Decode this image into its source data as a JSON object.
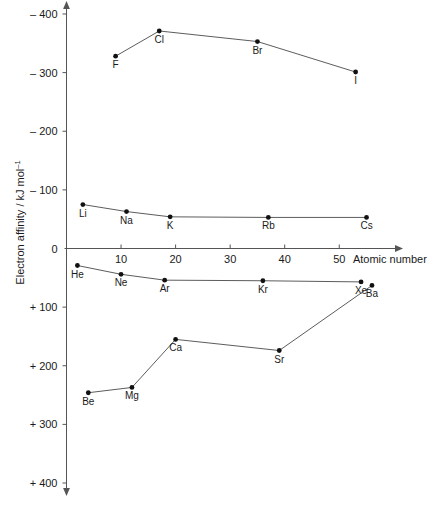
{
  "chart_data": {
    "type": "line",
    "title": "",
    "xlabel": "Atomic number",
    "ylabel": "Electron affinity / kJ mol−1",
    "ylabel_base": "Electron affinity / kJ mol",
    "ylabel_exponent": "–1",
    "xlim": [
      0,
      60
    ],
    "ylim": [
      -400,
      400
    ],
    "y_axis_inverted": true,
    "grid": false,
    "legend": "none",
    "x_ticks": [
      10,
      20,
      30,
      40,
      50
    ],
    "x_tick_labels": [
      "10",
      "20",
      "30",
      "40",
      "50"
    ],
    "y_ticks": [
      -400,
      -300,
      -200,
      -100,
      0,
      100,
      200,
      300,
      400
    ],
    "y_tick_labels": [
      "– 400",
      "– 300",
      "– 200",
      "– 100",
      "0",
      "+ 100",
      "+ 200",
      "+ 300",
      "+ 400"
    ],
    "zero_line": true,
    "series": [
      {
        "name": "halogens",
        "points": [
          {
            "label": "F",
            "x": 9,
            "y": -328,
            "label_pos": "below"
          },
          {
            "label": "Cl",
            "x": 17,
            "y": -371,
            "label_pos": "below"
          },
          {
            "label": "Br",
            "x": 35,
            "y": -353,
            "label_pos": "below"
          },
          {
            "label": "I",
            "x": 53,
            "y": -301,
            "label_pos": "below"
          }
        ]
      },
      {
        "name": "alkali-metals",
        "points": [
          {
            "label": "Li",
            "x": 3,
            "y": -75,
            "label_pos": "below"
          },
          {
            "label": "Na",
            "x": 11,
            "y": -63,
            "label_pos": "below"
          },
          {
            "label": "K",
            "x": 19,
            "y": -54,
            "label_pos": "below"
          },
          {
            "label": "Rb",
            "x": 37,
            "y": -53,
            "label_pos": "below"
          },
          {
            "label": "Cs",
            "x": 55,
            "y": -53,
            "label_pos": "below"
          }
        ]
      },
      {
        "name": "noble-gases",
        "points": [
          {
            "label": "He",
            "x": 2,
            "y": 29,
            "label_pos": "below"
          },
          {
            "label": "Ne",
            "x": 10,
            "y": 44,
            "label_pos": "below"
          },
          {
            "label": "Ar",
            "x": 18,
            "y": 54,
            "label_pos": "below"
          },
          {
            "label": "Kr",
            "x": 36,
            "y": 55,
            "label_pos": "below"
          },
          {
            "label": "Xe",
            "x": 54,
            "y": 57,
            "label_pos": "below"
          }
        ]
      },
      {
        "name": "alkaline-earth-metals",
        "points": [
          {
            "label": "Be",
            "x": 4,
            "y": 246,
            "label_pos": "below"
          },
          {
            "label": "Mg",
            "x": 12,
            "y": 237,
            "label_pos": "below"
          },
          {
            "label": "Ca",
            "x": 20,
            "y": 155,
            "label_pos": "below"
          },
          {
            "label": "Sr",
            "x": 39,
            "y": 174,
            "label_pos": "below"
          },
          {
            "label": "Ba",
            "x": 56,
            "y": 63,
            "label_pos": "below"
          }
        ]
      }
    ]
  },
  "colors": {
    "axis": "#555555",
    "line": "#4a4a4a",
    "point": "#111111",
    "text": "#1a1a1a",
    "background": "#ffffff"
  }
}
